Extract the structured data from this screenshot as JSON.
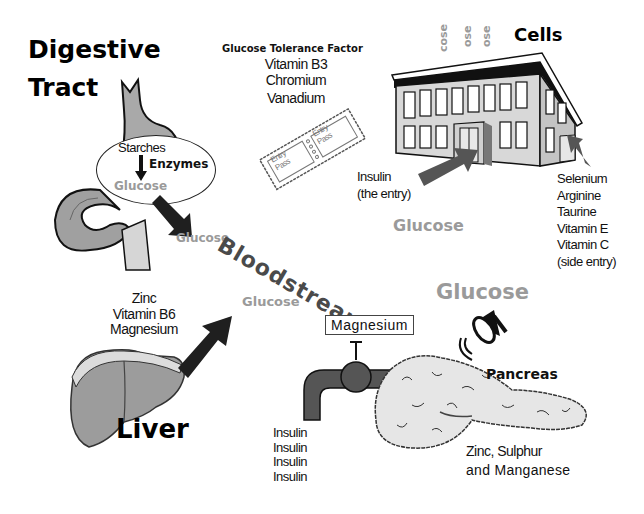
{
  "digestive": {
    "title_line1": "Digestive",
    "title_line2": "Tract",
    "ellipse": {
      "starches": "Starches",
      "enzymes": "Enzymes",
      "glucose": "Glucose"
    },
    "glucose_out": "Glucose"
  },
  "gtf": {
    "title": "Glucose Tolerance Factor",
    "items": [
      "Vitamin B3",
      "Chromium",
      "Vanadium"
    ],
    "ticket_label_1": "Entry Pass",
    "ticket_label_2": "Entry Pass"
  },
  "cells": {
    "title": "Cells",
    "rising_glucose": [
      "cose",
      "ose",
      "ose"
    ],
    "insulin_label": [
      "Insulin",
      "(the entry)"
    ],
    "side_entry_items": [
      "Selenium",
      "Arginine",
      "Taurine",
      "Vitamin E",
      "Vitamin C",
      "(side entry)"
    ],
    "glucose": "Glucose"
  },
  "bloodstream": {
    "label": "Bloodstream"
  },
  "liver": {
    "title": "Liver",
    "nutrients": [
      "Zinc",
      "Vitamin B6",
      "Magnesium"
    ],
    "glucose": "Glucose"
  },
  "pancreas": {
    "title": "Pancreas",
    "glucose": "Glucose",
    "valve_label": "Magnesium",
    "insulin_output": [
      "Insulin",
      "Insulin",
      "Insulin",
      "Insulin"
    ],
    "nutrients": [
      "Zinc, Sulphur",
      "and Manganese"
    ]
  },
  "colors": {
    "glucose_gray": "#9a9a9a",
    "arrow_dark": "#222222",
    "arrow_gray": "#555555",
    "organ_gray": "#9c9c9c",
    "building_wall": "#d8d8d8",
    "pancreas_fill": "#e6e6e6"
  }
}
